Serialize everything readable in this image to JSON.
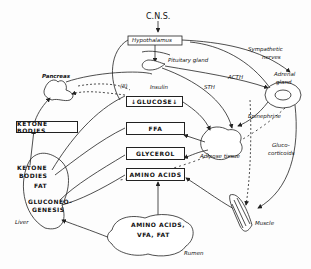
{
  "diagram": {
    "nodes": {
      "cns": "C.N.S.",
      "hypothalamus": "Hypothalamus",
      "pituitary": "Pituitary gland",
      "sympathetic": "Sympathetic",
      "nerves": "nerves",
      "adrenal1": "Adrenal",
      "adrenal2": "gland",
      "pancreas": "Pancreas",
      "ketone_box": "KETONE BODIES",
      "glucose": "GLUCOSE",
      "ffa": "FFA",
      "glycerol": "GLYCEROL",
      "amino_acids": "AMINO ACIDS",
      "adipose": "Adipose tissue",
      "liver_ketone1": "KETONE",
      "liver_ketone2": "BODIES",
      "liver_fat": "FAT",
      "gluconeo1": "GLUCONEO-",
      "gluconeo2": "GENESIS",
      "liver": "Liver",
      "rumen_content1": "AMINO ACIDS,",
      "rumen_content2": "VFA, FAT",
      "rumen": "Rumen",
      "muscle": "Muscle"
    },
    "hormones": {
      "insulin": "Insulin",
      "glucagon": "(II)",
      "acth": "ACTH",
      "sth": "STH",
      "epinephrine": "Epinephrine",
      "gluco1": "Gluco-",
      "gluco2": "corticoids"
    },
    "glucose_arrows": {
      "left": "↓",
      "right": "↓"
    }
  }
}
